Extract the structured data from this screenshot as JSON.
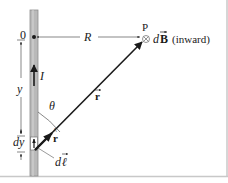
{
  "diagram": {
    "colors": {
      "wire_fill": "#b9b9b9",
      "wire_edge": "#8e8e8e",
      "ink": "#1a1a1a",
      "frame": "#c8c8c8",
      "background": "#ffffff"
    },
    "labels": {
      "origin": "0",
      "distance": "R",
      "point": "P",
      "field_symbol": "⊗",
      "field_d": "d",
      "field_B": "B",
      "field_note": "(inward)",
      "current": "I",
      "y_coord": "y",
      "angle": "θ",
      "position_vector": "r",
      "unit_vector": "r",
      "element_d": "d",
      "element_l": "ℓ",
      "dy_d": "d",
      "dy_y": "y"
    }
  }
}
